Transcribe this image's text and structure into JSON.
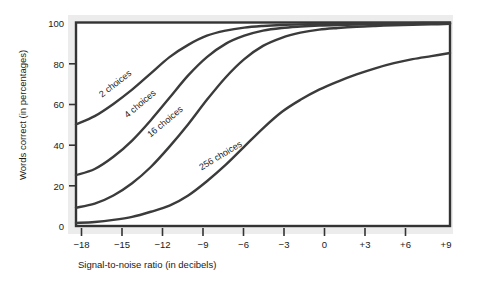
{
  "chart_data": {
    "type": "line",
    "title": "",
    "xlabel": "Signal-to-noise ratio (in decibels)",
    "ylabel": "Words correct (in percentages)",
    "xlim": [
      -19.5,
      10.5
    ],
    "ylim": [
      0,
      100
    ],
    "grid": false,
    "legend_position": "inline-curve-labels",
    "xticks": [
      -18,
      -15,
      -12,
      -9,
      -6,
      -3,
      0,
      3,
      6,
      9
    ],
    "xticklabels": [
      "−18",
      "−15",
      "−12",
      "−9",
      "−6",
      "−3",
      "0",
      "+3",
      "+6",
      "+9"
    ],
    "yticks": [
      0,
      20,
      40,
      60,
      80,
      100
    ],
    "yticklabels": [
      "0",
      "20",
      "40",
      "60",
      "80",
      "100"
    ],
    "x": [
      -19.5,
      -18,
      -16.5,
      -15,
      -13.5,
      -12,
      -10.5,
      -9,
      -7.5,
      -6,
      -4.5,
      -3,
      -1.5,
      0,
      1.5,
      3,
      4.5,
      6,
      7.5,
      9,
      10.5
    ],
    "series": [
      {
        "name": "2 choices",
        "label": "2 choices",
        "color": "#3b3b3b",
        "values": [
          50,
          54,
          60,
          67,
          75,
          83,
          89,
          93.5,
          96,
          97.5,
          98.3,
          98.8,
          99.1,
          99.3,
          99.4,
          99.5,
          99.6,
          99.7,
          99.7,
          99.8,
          99.8
        ]
      },
      {
        "name": "4 choices",
        "label": "4 choices",
        "color": "#3b3b3b",
        "values": [
          25,
          28,
          34,
          42,
          52,
          63,
          74,
          83,
          89.5,
          93.5,
          96,
          97.3,
          98,
          98.5,
          98.8,
          99,
          99.2,
          99.3,
          99.4,
          99.5,
          99.6
        ]
      },
      {
        "name": "16 choices",
        "label": "16 choices",
        "color": "#3b3b3b",
        "values": [
          9,
          11,
          15,
          21,
          29,
          39,
          50,
          62,
          73,
          82,
          88.5,
          92.5,
          95,
          96.5,
          97.3,
          97.9,
          98.3,
          98.6,
          98.9,
          99.1,
          99.3
        ]
      },
      {
        "name": "256 choices",
        "label": "256 choices",
        "color": "#3b3b3b",
        "values": [
          1.5,
          2,
          3,
          4.5,
          7,
          10,
          15,
          22,
          30,
          39,
          48,
          56,
          62,
          67,
          71,
          74.5,
          77.5,
          80,
          82,
          83.5,
          85
        ]
      }
    ],
    "curve_labels": [
      {
        "text": "2 choices",
        "x": 117,
        "y": 86,
        "rotate": -38
      },
      {
        "text": "4 choices",
        "x": 142,
        "y": 106,
        "rotate": -40
      },
      {
        "text": "16 choices",
        "x": 167,
        "y": 124,
        "rotate": -40
      },
      {
        "text": "256 choices",
        "x": 222,
        "y": 158,
        "rotate": -31
      }
    ],
    "colors": {
      "curve": "#3b3b3b",
      "frame": "#2b2b2b",
      "shadow": "#e6e6e6",
      "text": "#1a1a1a",
      "background": "#ffffff"
    }
  }
}
